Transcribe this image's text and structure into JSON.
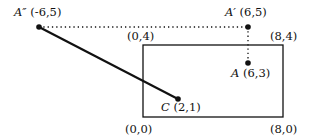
{
  "diagram": {
    "type": "coordinate-geometry",
    "rectangle": {
      "corners": [
        {
          "label": "(0,0)",
          "coord": [
            0,
            0
          ]
        },
        {
          "label": "(8,0)",
          "coord": [
            8,
            0
          ]
        },
        {
          "label": "(8,4)",
          "coord": [
            8,
            4
          ]
        },
        {
          "label": "(0,4)",
          "coord": [
            0,
            4
          ]
        }
      ]
    },
    "points": [
      {
        "name": "A″",
        "coord_text": "(-6,5)",
        "coord": [
          -6,
          5
        ]
      },
      {
        "name": "A′",
        "coord_text": "(6,5)",
        "coord": [
          6,
          5
        ]
      },
      {
        "name": "A",
        "coord_text": "(6,3)",
        "coord": [
          6,
          3
        ]
      },
      {
        "name": "C",
        "coord_text": "(2,1)",
        "coord": [
          2,
          1
        ]
      }
    ],
    "segments": [
      {
        "from": "A″",
        "to": "C",
        "style": "solid"
      },
      {
        "from": "A″",
        "to": "A′",
        "style": "dotted"
      },
      {
        "from": "A′",
        "to": "A",
        "style": "dotted"
      }
    ],
    "colors": {
      "ink": "#111111",
      "background": "#ffffff"
    }
  }
}
